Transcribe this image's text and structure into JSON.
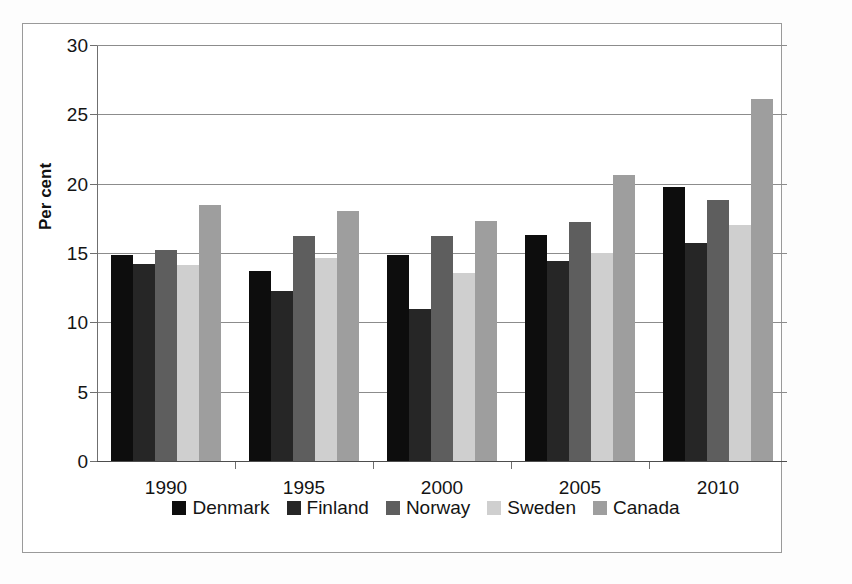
{
  "chart_data": {
    "type": "bar",
    "title": "",
    "subtitle": "",
    "xlabel": "",
    "ylabel": "Per cent",
    "categories": [
      "1990",
      "1995",
      "2000",
      "2005",
      "2010"
    ],
    "ylim": [
      0,
      30
    ],
    "yticks": [
      0,
      5,
      10,
      15,
      20,
      25,
      30
    ],
    "ytick_labels": [
      "0",
      "5",
      "10",
      "15",
      "20",
      "25",
      "30"
    ],
    "grid": "horizontal",
    "legend_position": "bottom",
    "series": [
      {
        "name": "Denmark",
        "color": "#0d0d0d",
        "values": [
          14.9,
          13.8,
          14.9,
          16.4,
          19.8
        ]
      },
      {
        "name": "Finland",
        "color": "#262626",
        "values": [
          14.3,
          12.3,
          11.0,
          14.5,
          15.8
        ]
      },
      {
        "name": "Norway",
        "color": "#5e5e5e",
        "values": [
          15.3,
          16.3,
          16.3,
          17.3,
          18.9
        ]
      },
      {
        "name": "Sweden",
        "color": "#cfcfcf",
        "values": [
          14.2,
          14.7,
          13.6,
          15.1,
          17.1
        ]
      },
      {
        "name": "Canada",
        "color": "#9e9e9e",
        "values": [
          18.5,
          18.1,
          17.4,
          20.7,
          26.2
        ]
      }
    ]
  },
  "legend": {
    "items": [
      {
        "label": "Denmark",
        "color": "#0d0d0d"
      },
      {
        "label": "Finland",
        "color": "#262626"
      },
      {
        "label": "Norway",
        "color": "#5e5e5e"
      },
      {
        "label": "Sweden",
        "color": "#cfcfcf"
      },
      {
        "label": "Canada",
        "color": "#9e9e9e"
      }
    ]
  },
  "colors": {
    "background": "#ffffff",
    "frame": "#9a9a9a",
    "gridline": "#8c8c8c",
    "axis": "#4d4d4d",
    "text": "#141414"
  }
}
